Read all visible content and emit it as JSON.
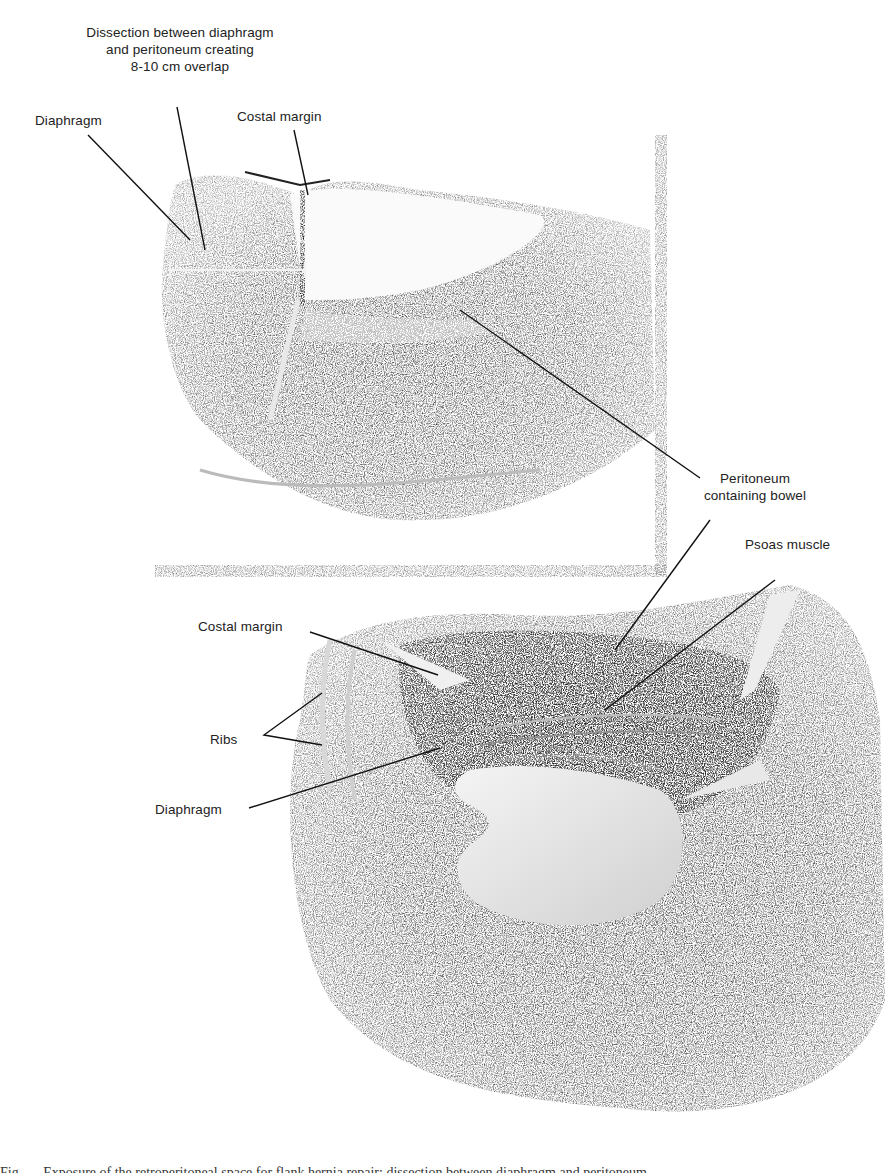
{
  "figure": {
    "type": "surgical illustration",
    "panels": [
      {
        "id": "top",
        "labels": [
          {
            "key": "dissection",
            "text": "Dissection between diaphragm\nand peritoneum creating\n8-10 cm overlap"
          },
          {
            "key": "diaphragm",
            "text": "Diaphragm"
          },
          {
            "key": "costal_margin",
            "text": "Costal margin"
          },
          {
            "key": "peritoneum",
            "text": "Peritoneum\ncontaining bowel"
          }
        ]
      },
      {
        "id": "bottom",
        "labels": [
          {
            "key": "psoas",
            "text": "Psoas muscle"
          },
          {
            "key": "costal_margin",
            "text": "Costal margin"
          },
          {
            "key": "ribs",
            "text": "Ribs"
          },
          {
            "key": "diaphragm",
            "text": "Diaphragm"
          }
        ]
      }
    ]
  },
  "labels": {
    "dissection_l1": "Dissection between diaphragm",
    "dissection_l2": "and peritoneum creating",
    "dissection_l3": "8-10 cm overlap",
    "top_diaphragm": "Diaphragm",
    "top_costal_margin": "Costal margin",
    "peritoneum_l1": "Peritoneum",
    "peritoneum_l2": "containing bowel",
    "psoas": "Psoas muscle",
    "bottom_costal_margin": "Costal margin",
    "ribs": "Ribs",
    "bottom_diaphragm": "Diaphragm"
  },
  "caption": "Fig. — Exposure of the retroperitoneal space for flank hernia repair; dissection between diaphragm and peritoneum"
}
